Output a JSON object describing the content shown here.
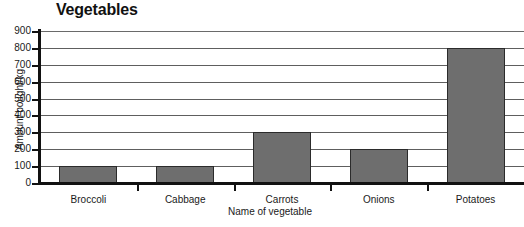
{
  "chart_data": {
    "type": "bar",
    "title": "Vegetables",
    "xlabel": "Name of vegetable",
    "ylabel": "Amount bought/kg",
    "categories": [
      "Broccoli",
      "Cabbage",
      "Carrots",
      "Onions",
      "Potatoes"
    ],
    "values": [
      100,
      100,
      300,
      200,
      800
    ],
    "ylim": [
      0,
      900
    ],
    "ytick_step": 100,
    "yticks": [
      0,
      100,
      200,
      300,
      400,
      500,
      600,
      700,
      800,
      900
    ],
    "ytick_labels": [
      "0",
      "100",
      "200",
      "300",
      "400",
      "500",
      "600",
      "700",
      "800",
      "900"
    ],
    "grid": true,
    "grid_axis": "y",
    "legend": false,
    "bar_fill_color": "#6e6e6e",
    "bar_edge_color": "#2b2b2b",
    "axis_color": "#111111",
    "gridline_color": "#5e5e5e",
    "background_color": "#ffffff"
  }
}
